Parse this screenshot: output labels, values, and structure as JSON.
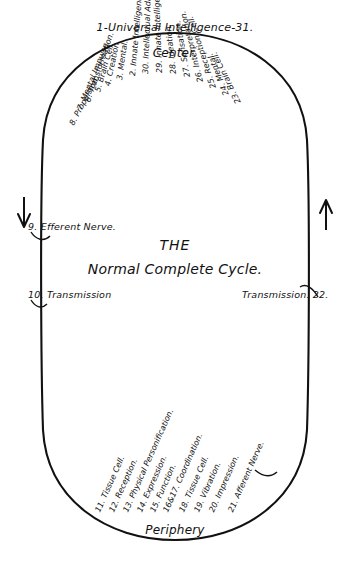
{
  "diagram": {
    "title_top": "1-Universal Intelligence-31.",
    "center_word": "Center.",
    "periphery_word": "Periphery",
    "center_text_line1": "THE",
    "center_text_line2": "Normal Complete Cycle.",
    "left_label_efferent": "9. Efferent Nerve.",
    "left_label_transmission": "10. Transmission",
    "right_label_transmission": "Transmission. 22.",
    "ink_color": "#111111",
    "background_color": "#ffffff"
  },
  "top_spokes": [
    {
      "label": "8. Propulsion.",
      "angle": -62,
      "x": 72,
      "y": 121
    },
    {
      "label": "7. Mental Impulse.",
      "angle": -68,
      "x": 80,
      "y": 106
    },
    {
      "label": "6. Transformation.",
      "angle": -71,
      "x": 88,
      "y": 98
    },
    {
      "label": "5. Brain Cell.",
      "angle": -74,
      "x": 98,
      "y": 88
    },
    {
      "label": "4. Creation.",
      "angle": -78,
      "x": 108,
      "y": 82
    },
    {
      "label": "3. Mental.",
      "angle": -82,
      "x": 120,
      "y": 76
    },
    {
      "label": "2. Innate Intelligence.",
      "angle": -85,
      "x": 133,
      "y": 72
    },
    {
      "label": "30. Intellectual Adaptation.",
      "angle": -88,
      "x": 146,
      "y": 70
    },
    {
      "label": "29. Innate Intelligence.",
      "angle": -92,
      "x": 160,
      "y": 69
    },
    {
      "label": "28. Ideation.",
      "angle": -96,
      "x": 174,
      "y": 70
    },
    {
      "label": "27. Sensation.",
      "angle": -100,
      "x": 188,
      "y": 73
    },
    {
      "label": "26. Interpretation.",
      "angle": -104,
      "x": 201,
      "y": 78
    },
    {
      "label": "25. Reception Cell.",
      "angle": -108,
      "x": 214,
      "y": 84
    },
    {
      "label": "24. Mental.",
      "angle": -112,
      "x": 227,
      "y": 91
    },
    {
      "label": "23. Brain Cell.",
      "angle": -116,
      "x": 239,
      "y": 99
    }
  ],
  "bottom_spokes": [
    {
      "label": "11. Tissue Cell.",
      "angle": -66,
      "x": 98,
      "y": 508
    },
    {
      "label": "12. Reception.",
      "angle": -66,
      "x": 112,
      "y": 508
    },
    {
      "label": "13. Physical Personification.",
      "angle": -66,
      "x": 126,
      "y": 508
    },
    {
      "label": "14. Expression.",
      "angle": -66,
      "x": 140,
      "y": 508
    },
    {
      "label": "15. Function.",
      "angle": -66,
      "x": 153,
      "y": 508
    },
    {
      "label": "16&17. Coordination.",
      "angle": -66,
      "x": 166,
      "y": 508
    },
    {
      "label": "18. Tissue Cell.",
      "angle": -66,
      "x": 182,
      "y": 508
    },
    {
      "label": "19. Vibration.",
      "angle": -66,
      "x": 197,
      "y": 508
    },
    {
      "label": "20. Impression.",
      "angle": -66,
      "x": 212,
      "y": 508
    },
    {
      "label": "21. Afferent Nerve.",
      "angle": -66,
      "x": 231,
      "y": 508
    }
  ]
}
